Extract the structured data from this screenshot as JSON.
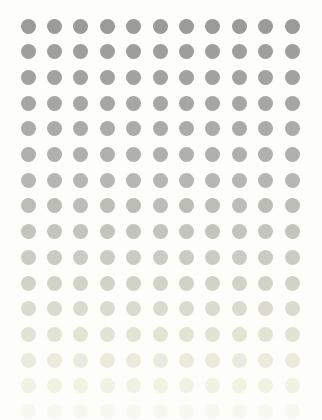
{
  "canvas": {
    "width": 322,
    "height": 420,
    "background": "#fdfdf9"
  },
  "grid": {
    "columns": 11,
    "rows": 16,
    "origin_x": 28,
    "origin_y": 26,
    "spacing_x": 26.4,
    "spacing_y": 25.7,
    "dot_diameter": 15,
    "row_colors": [
      "#9b9b99",
      "#9e9e9b",
      "#a2a29f",
      "#a6a7a2",
      "#abaca7",
      "#b0b1ab",
      "#b6b7b0",
      "#bcbdb5",
      "#c3c4bb",
      "#cacbc1",
      "#d2d3c7",
      "#dadbce",
      "#e2e3d5",
      "#eaebdc",
      "#f1f2e4",
      "#f7f8ee"
    ]
  }
}
